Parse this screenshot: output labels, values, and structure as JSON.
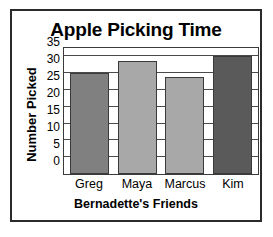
{
  "chart_data": {
    "type": "bar",
    "title": "Apple Picking Time",
    "xlabel": "Bernadette's Friends",
    "ylabel": "Number Picked",
    "categories": [
      "Greg",
      "Maya",
      "Marcus",
      "Kim"
    ],
    "values": [
      30,
      33.5,
      29,
      35
    ],
    "bar_colors": [
      "#808080",
      "#a8a8a8",
      "#a8a8a8",
      "#5a5a5a"
    ],
    "yticks": [
      0,
      5,
      10,
      15,
      20,
      25,
      30,
      35
    ],
    "ytick_labels": [
      "0",
      "5",
      "10",
      "15",
      "20",
      "25",
      "30",
      "35"
    ],
    "ylim": [
      0,
      37.5
    ],
    "grid": true,
    "grid_axis": "y",
    "legend": false,
    "frame_color": "#2b2b2b",
    "axis_color": "#3a3a3a"
  }
}
